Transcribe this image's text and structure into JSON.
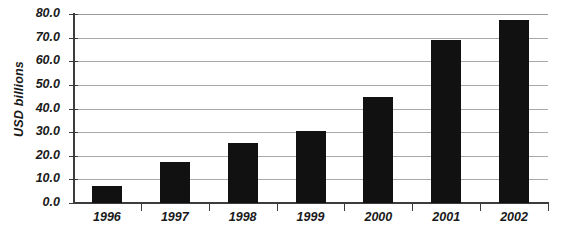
{
  "chart_data": {
    "type": "bar",
    "title": "",
    "xlabel": "",
    "ylabel": "USD billions",
    "categories": [
      "1996",
      "1997",
      "1998",
      "1999",
      "2000",
      "2001",
      "2002"
    ],
    "values": [
      7.0,
      17.5,
      25.5,
      30.5,
      45.0,
      69.0,
      77.5
    ],
    "series": [
      {
        "name": "USD billions",
        "values": [
          7.0,
          17.5,
          25.5,
          30.5,
          45.0,
          69.0,
          77.5
        ]
      }
    ],
    "ylim": [
      0.0,
      80.0
    ],
    "ytick_step": 10.0,
    "ytick_labels": [
      "0.0",
      "10.0",
      "20.0",
      "30.0",
      "40.0",
      "50.0",
      "60.0",
      "70.0",
      "80.0"
    ],
    "ytick_values": [
      0.0,
      10.0,
      20.0,
      30.0,
      40.0,
      50.0,
      60.0,
      70.0,
      80.0
    ],
    "grid": true,
    "grid_axis": "y",
    "legend": false,
    "legend_position": "none",
    "colors": {
      "bar": "#111111",
      "gridline": "#a8a8a8",
      "axis": "#3c3c3c",
      "text": "#1a1a1a",
      "background": "#ffffff"
    }
  }
}
